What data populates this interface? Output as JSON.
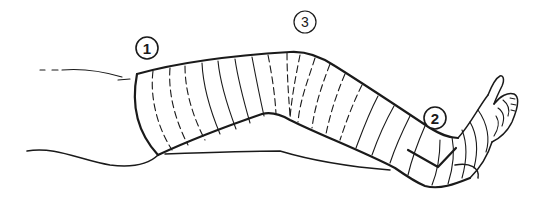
{
  "figure": {
    "callouts": [
      {
        "label": "1",
        "x": 147,
        "y": 48
      },
      {
        "label": "2",
        "x": 435,
        "y": 118
      },
      {
        "label": "3",
        "x": 305,
        "y": 22
      }
    ],
    "colors": {
      "ink": "#1a1a1a",
      "background": "#ffffff"
    }
  }
}
